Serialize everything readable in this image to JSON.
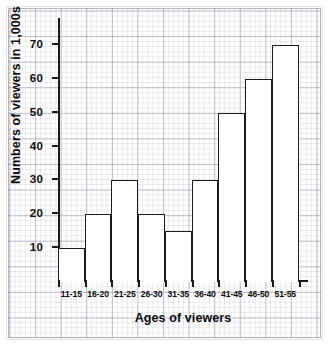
{
  "chart_data": {
    "type": "bar",
    "title": "",
    "xlabel": "Ages of viewers",
    "ylabel": "Numbers of viewers in 1,000s",
    "categories": [
      "11-15",
      "16-20",
      "21-25",
      "26-30",
      "31-35",
      "36-40",
      "41-45",
      "46-50",
      "51-55"
    ],
    "values": [
      10,
      20,
      30,
      20,
      15,
      30,
      50,
      60,
      70
    ],
    "yticks": [
      10,
      20,
      30,
      40,
      50,
      60,
      70
    ],
    "ylim": [
      0,
      78
    ],
    "xlim_categories": 9,
    "grid": true,
    "grid_style": "graph-paper",
    "legend": "none",
    "bar_fill": "#ffffff",
    "bar_edge": "#1c1c1c",
    "axis_color": "#1a1a1a",
    "background": "#ffffff"
  },
  "axes": {
    "y": {
      "title": "Numbers of viewers in 1,000s",
      "tick_labels": [
        "70",
        "60",
        "50",
        "40",
        "30",
        "20",
        "10"
      ]
    },
    "x": {
      "title": "Ages of viewers",
      "tick_labels": [
        "11-15",
        "16-20",
        "21-25",
        "26-30",
        "31-35",
        "36-40",
        "41-45",
        "46-50",
        "51-55"
      ]
    }
  }
}
